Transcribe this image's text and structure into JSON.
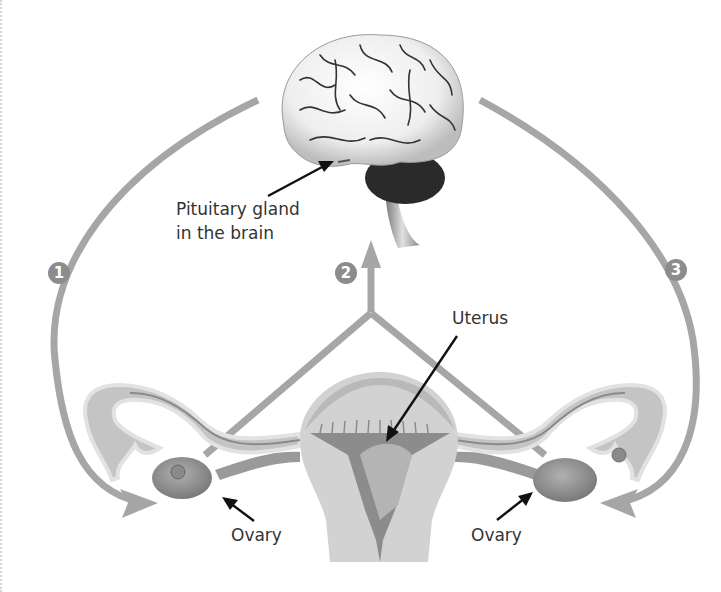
{
  "diagram": {
    "labels": {
      "pituitary_line1": "Pituitary gland",
      "pituitary_line2": "in the brain",
      "uterus": "Uterus",
      "ovary_left": "Ovary",
      "ovary_right": "Ovary"
    },
    "steps": [
      {
        "number": "1",
        "description": "Pituitary gland to left ovary"
      },
      {
        "number": "2",
        "description": "Ovaries to pituitary gland"
      },
      {
        "number": "3",
        "description": "Pituitary gland to right ovary"
      }
    ],
    "colors": {
      "arrow": "#a6a6a6",
      "badge": "#8c8c8c",
      "uterus_light": "#cfcfcf",
      "uterus_dark": "#8a8a8a",
      "ovary": "#8f8f8f",
      "brain_cerebellum": "#2a2a2a",
      "text": "#333333"
    }
  }
}
